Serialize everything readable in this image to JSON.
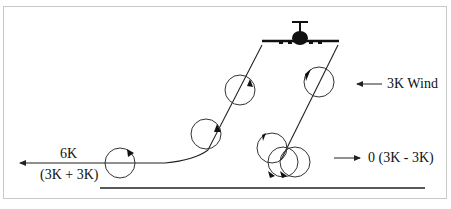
{
  "diagram": {
    "labels": {
      "wind": "3K Wind",
      "left_speed": "6K",
      "left_formula": "(3K + 3K)",
      "right_result": "0 (3K - 3K)"
    },
    "elements": {
      "aircraft": "aircraft-front-view",
      "left_vortex_track": [
        "vortex-1 (near aircraft)",
        "vortex-2",
        "vortex-3 (ground)"
      ],
      "right_vortex_track": [
        "vortex-1 (near aircraft)",
        "stalled vortices over ground"
      ],
      "ground": "ground-line"
    },
    "colors": {
      "stroke": "#222222",
      "frame": "#c9c9c9",
      "background": "#ffffff"
    }
  }
}
